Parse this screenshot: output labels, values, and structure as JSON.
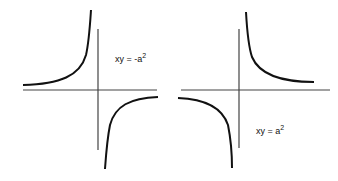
{
  "diagram": {
    "panels": [
      {
        "name": "negative-hyperbola",
        "equation": "xy = -a",
        "exponent": "2"
      },
      {
        "name": "positive-hyperbola",
        "equation": "xy = a",
        "exponent": "2"
      }
    ],
    "colors": {
      "curve": "#111111",
      "axis": "#444444",
      "background": "#ffffff"
    }
  }
}
